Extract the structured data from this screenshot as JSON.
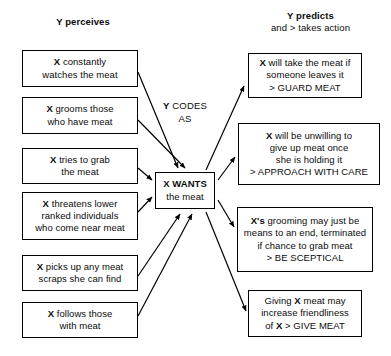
{
  "diagram": {
    "title_left": "Y perceives",
    "title_right_line1": "Y predicts",
    "title_right_line2": "and > takes action",
    "middle_label_line1": "Y CODES",
    "middle_label_line2": "AS",
    "center_box_line1": "X WANTS",
    "center_box_line2": "the meat",
    "colors": {
      "stroke": "#000000",
      "text": "#0b0b0b",
      "background": "#ffffff"
    },
    "left_boxes": [
      {
        "line1": "X constantly",
        "line2": "watches the meat",
        "line3": ""
      },
      {
        "line1": "X grooms those",
        "line2": "who have meat",
        "line3": ""
      },
      {
        "line1": "X tries to grab",
        "line2": "the meat",
        "line3": ""
      },
      {
        "line1": "X threatens lower",
        "line2": "ranked individuals",
        "line3": "who come near meat"
      },
      {
        "line1": "X picks up any meat",
        "line2": "scraps she can find",
        "line3": ""
      },
      {
        "line1": "X follows those",
        "line2": "with meat",
        "line3": ""
      }
    ],
    "right_boxes": [
      {
        "line1": "X will take the meat if",
        "line2": "someone leaves it",
        "line3": "> GUARD MEAT",
        "line4": ""
      },
      {
        "line1": "X  will be unwilling to",
        "line2": "give up meat once",
        "line3": "she is holding it",
        "line4": "> APPROACH WITH CARE"
      },
      {
        "line1": "X's grooming may just be",
        "line2": "means to an end, terminated",
        "line3": "if chance to grab meat",
        "line4": "> BE SCEPTICAL"
      },
      {
        "line1": "Giving X meat may",
        "line2": "increase friendliness",
        "line3": "of X > GIVE MEAT",
        "line4": ""
      }
    ]
  }
}
